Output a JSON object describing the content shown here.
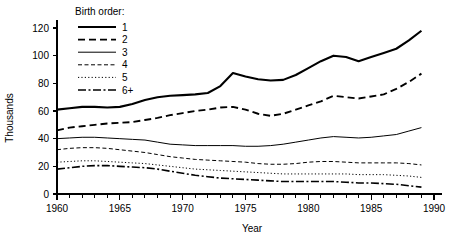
{
  "chart_data": {
    "type": "line",
    "title": "",
    "xlabel": "Year",
    "ylabel": "Thousands",
    "xlim": [
      1960,
      1990
    ],
    "ylim": [
      0,
      128
    ],
    "grid": false,
    "legend_position": "top-left",
    "legend_title": "Birth order:",
    "y_ticks": [
      0,
      20,
      40,
      60,
      80,
      100,
      120
    ],
    "y_tick_labels": [
      "0",
      "20",
      "40",
      "60",
      "80",
      "100",
      "120"
    ],
    "x_ticks": [
      1960,
      1965,
      1970,
      1975,
      1980,
      1985,
      1990
    ],
    "x_tick_labels": [
      "1960",
      "1965",
      "1970",
      "1975",
      "1980",
      "1985",
      "1990"
    ],
    "x_minor_step": 1,
    "x": [
      1960,
      1961,
      1962,
      1963,
      1964,
      1965,
      1966,
      1967,
      1968,
      1969,
      1970,
      1971,
      1972,
      1973,
      1974,
      1975,
      1976,
      1977,
      1978,
      1979,
      1980,
      1981,
      1982,
      1983,
      1984,
      1985,
      1986,
      1987,
      1988,
      1989
    ],
    "series": [
      {
        "name": "1",
        "label": "1",
        "style": "solid",
        "width": 2.1,
        "dash": "none",
        "values": [
          61,
          62,
          63,
          63,
          62.5,
          63,
          65,
          68,
          70,
          71,
          71.5,
          72,
          73,
          78,
          87.5,
          85,
          83,
          82,
          82.5,
          86,
          91,
          96,
          100,
          99,
          96,
          99,
          102,
          105,
          111,
          118
        ]
      },
      {
        "name": "2",
        "label": "2",
        "style": "dashed",
        "width": 1.9,
        "dash": "7,4",
        "values": [
          46,
          48,
          49,
          50,
          51,
          51.5,
          52,
          53.5,
          55,
          57,
          58.5,
          60,
          61,
          62.5,
          63,
          61,
          58,
          56.5,
          58,
          61,
          64,
          67,
          71,
          70,
          69,
          70.5,
          72,
          76,
          81,
          87
        ]
      },
      {
        "name": "3",
        "label": "3",
        "style": "solid-thin",
        "width": 1.0,
        "dash": "none",
        "values": [
          40,
          40.5,
          41,
          41,
          40.5,
          40,
          39.5,
          39,
          37.5,
          36,
          35.5,
          35,
          35,
          35,
          35,
          34.5,
          34.5,
          35,
          36,
          37.5,
          39,
          40.5,
          41.5,
          41,
          40.5,
          41,
          42,
          43,
          45.5,
          48
        ]
      },
      {
        "name": "4",
        "label": "4",
        "style": "short-dash",
        "width": 1.0,
        "dash": "4,2.5",
        "values": [
          32,
          33,
          33.5,
          33.5,
          33,
          32,
          31,
          30,
          28.5,
          27,
          26,
          25,
          24.5,
          24,
          23.5,
          23,
          22,
          21.5,
          21.5,
          22,
          23,
          23.5,
          23.5,
          23,
          22.5,
          22.5,
          22.5,
          22.5,
          22,
          21
        ]
      },
      {
        "name": "5",
        "label": "5",
        "style": "dotted",
        "width": 1.0,
        "dash": "1.2,2.2",
        "values": [
          23,
          23.5,
          24,
          24,
          23.5,
          23,
          22.5,
          22,
          21,
          20,
          19,
          18,
          17.5,
          17,
          16.5,
          16,
          15.5,
          15,
          14.5,
          14.5,
          14.5,
          14.5,
          14.5,
          14.5,
          14,
          14,
          14,
          13.5,
          13,
          12
        ]
      },
      {
        "name": "6+",
        "label": "6+",
        "style": "dash-dot",
        "width": 1.6,
        "dash": "8,2.5,2,2.5",
        "values": [
          18,
          19,
          20,
          20.5,
          20.5,
          20,
          19.5,
          19,
          18,
          16.5,
          15,
          13.5,
          12.5,
          11.5,
          11,
          10.5,
          10,
          9.5,
          9,
          9,
          9,
          9,
          9,
          8.5,
          8,
          8,
          7.5,
          7,
          6,
          5
        ]
      }
    ]
  },
  "legend": {
    "title": "Birth order:",
    "items": [
      {
        "label": "1"
      },
      {
        "label": "2"
      },
      {
        "label": "3"
      },
      {
        "label": "4"
      },
      {
        "label": "5"
      },
      {
        "label": "6+"
      }
    ]
  },
  "axes": {
    "y_title": "Thousands",
    "x_title": "Year"
  }
}
